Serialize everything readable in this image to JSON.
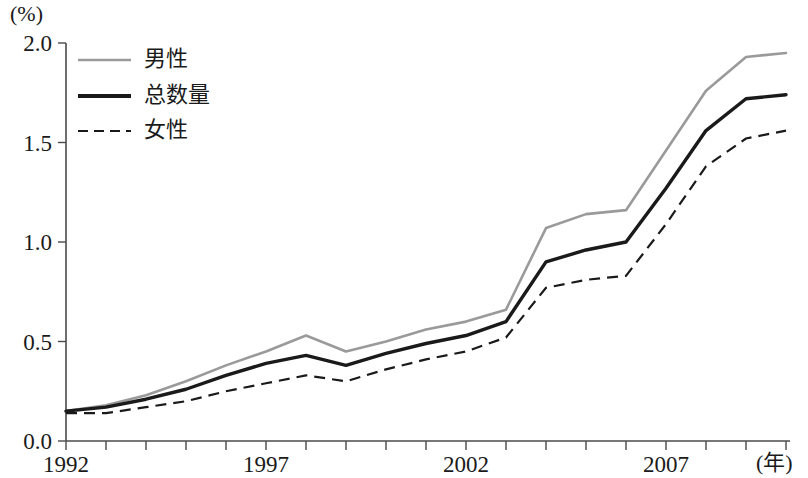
{
  "chart_data": {
    "type": "line",
    "title": "",
    "subtitle": "",
    "xlabel": "(年)",
    "ylabel": "(%)",
    "unit_label": "(%)",
    "x_axis_suffix": "(年)",
    "xlim": [
      1992,
      2010
    ],
    "ylim": [
      0.0,
      2.0
    ],
    "grid": false,
    "legend_position": "top-left",
    "x": [
      1992,
      1993,
      1994,
      1995,
      1996,
      1997,
      1998,
      1999,
      2000,
      2001,
      2002,
      2003,
      2004,
      2005,
      2006,
      2007,
      2008,
      2009,
      2010
    ],
    "categories": [
      "1992",
      "1993",
      "1994",
      "1995",
      "1996",
      "1997",
      "1998",
      "1999",
      "2000",
      "2001",
      "2002",
      "2003",
      "2004",
      "2005",
      "2006",
      "2007",
      "2008",
      "2009",
      "2010"
    ],
    "x_tick_labels": [
      "1992",
      "1997",
      "2002",
      "2007"
    ],
    "x_tick_values": [
      1992,
      1997,
      2002,
      2007
    ],
    "y_tick_labels": [
      "0.0",
      "0.5",
      "1.0",
      "1.5",
      "2.0"
    ],
    "y_tick_values": [
      0.0,
      0.5,
      1.0,
      1.5,
      2.0
    ],
    "series": [
      {
        "name": "男性",
        "style": "solid",
        "color": "#9a9a9a",
        "values": [
          0.15,
          0.18,
          0.23,
          0.3,
          0.38,
          0.45,
          0.53,
          0.45,
          0.5,
          0.56,
          0.6,
          0.66,
          1.07,
          1.14,
          1.16,
          1.46,
          1.76,
          1.93,
          1.95
        ]
      },
      {
        "name": "总数量",
        "style": "solid-bold",
        "color": "#1a1a1a",
        "values": [
          0.15,
          0.17,
          0.21,
          0.26,
          0.33,
          0.39,
          0.43,
          0.38,
          0.44,
          0.49,
          0.53,
          0.6,
          0.9,
          0.96,
          1.0,
          1.27,
          1.56,
          1.72,
          1.74
        ]
      },
      {
        "name": "女性",
        "style": "dashed",
        "color": "#1a1a1a",
        "values": [
          0.14,
          0.14,
          0.17,
          0.2,
          0.25,
          0.29,
          0.33,
          0.3,
          0.36,
          0.41,
          0.45,
          0.52,
          0.77,
          0.81,
          0.83,
          1.09,
          1.38,
          1.52,
          1.56
        ]
      }
    ]
  },
  "legend": {
    "items": [
      {
        "label": "男性"
      },
      {
        "label": "总数量"
      },
      {
        "label": "女性"
      }
    ]
  },
  "axes": {
    "y_unit": "(%)",
    "x_unit": "(年)"
  }
}
